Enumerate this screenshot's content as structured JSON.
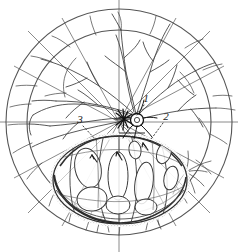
{
  "figure": {
    "background_color": "#ffffff",
    "ink_color": "#333333",
    "line_color_light": "#6b6b6b",
    "stipple_color": "#9a9a9a",
    "width": 238,
    "height": 252
  },
  "graticule": {
    "center_x": 119,
    "center_y": 122,
    "outer_circle_radius": 113,
    "inner_circle_radius": 92,
    "spoke_count": 8,
    "axis_horizontal_label": "horizontal-axis",
    "axis_vertical_label": "vertical-axis"
  },
  "disc": {
    "center_x": 137,
    "center_y": 120,
    "radius": 6,
    "name": "central-disc"
  },
  "starburst": {
    "center_x": 124,
    "center_y": 119,
    "ray_count": 12,
    "ray_length": 9,
    "name": "starburst-lesion"
  },
  "lower_oval": {
    "center_x": 120,
    "center_y": 180,
    "radius_x": 67,
    "radius_y": 44,
    "name": "lower-lobulated-mass",
    "lobule_count": 9
  },
  "callouts": [
    {
      "id": "callout-1",
      "label": "1",
      "x": 146,
      "y": 101,
      "leader_to_x": 136,
      "leader_to_y": 116
    },
    {
      "id": "callout-2",
      "label": "2",
      "x": 166,
      "y": 119,
      "leader_to_x": 148,
      "leader_to_y": 141
    },
    {
      "id": "callout-3",
      "label": "3",
      "x": 80,
      "y": 122,
      "leader_to_x": 95,
      "leader_to_y": 139
    }
  ],
  "arrows": [
    {
      "id": "arrow-left-lobule",
      "x": 95,
      "y": 158
    },
    {
      "id": "arrow-mid-lobule",
      "x": 120,
      "y": 155
    },
    {
      "id": "arrow-right-lobule",
      "x": 144,
      "y": 146
    }
  ]
}
